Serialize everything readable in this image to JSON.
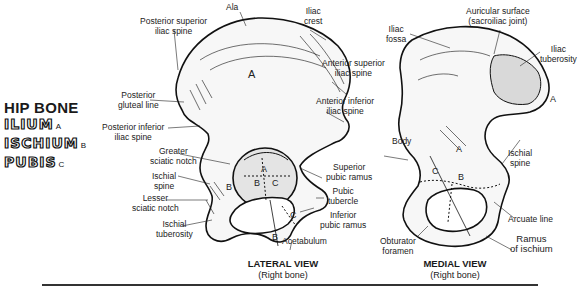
{
  "legend": {
    "title": "HIP BONE",
    "items": [
      {
        "name": "ILIUM",
        "tag": "A"
      },
      {
        "name": "ISCHIUM",
        "tag": "B"
      },
      {
        "name": "PUBIS",
        "tag": "C"
      }
    ]
  },
  "lateral_view": {
    "title": "LATERAL VIEW",
    "subtitle": "(Right bone)",
    "labels": {
      "ala": "Ala",
      "iliac_crest": "Iliac\ncrest",
      "posterior_superior_iliac_spine": "Posterior superior\niliac spine",
      "anterior_superior_iliac_spine": "Anterior superior\niliac spine",
      "posterior_gluteal_line": "Posterior\ngluteal line",
      "anterior_inferior_iliac_spine": "Anterior inferior\niliac spine",
      "posterior_inferior_iliac_spine": "Posterior inferior\niliac spine",
      "greater_sciatic_notch": "Greater\nsciatic notch",
      "ischial_spine": "Ischial\nspine",
      "lesser_sciatic_notch": "Lesser\nsciatic notch",
      "ischial_tuberosity": "Ischial\ntuberosity",
      "superior_pubic_ramus": "Superior\npubic ramus",
      "pubic_tubercle": "Pubic\ntubercle",
      "inferior_pubic_ramus": "Inferior\npubic ramus",
      "acetabulum": "Acetabulum"
    },
    "region_marks": [
      "A",
      "A",
      "B",
      "C",
      "B",
      "B",
      "C"
    ]
  },
  "medial_view": {
    "title": "MEDIAL VIEW",
    "subtitle": "(Right bone)",
    "labels": {
      "iliac_fossa": "Iliac\nfossa",
      "auricular_surface": "Auricular surface\n(sacroiliac joint)",
      "iliac_tuberosity": "Iliac\ntuberosity",
      "body": "Body",
      "ischial_spine": "Ischial\nspine",
      "arcuate_line": "Arcuate line",
      "obturator_foramen": "Obturator\nforamen",
      "ramus_of_ischium": "Ramus\nof ischium"
    },
    "region_marks": [
      "A",
      "A",
      "B",
      "C"
    ]
  }
}
